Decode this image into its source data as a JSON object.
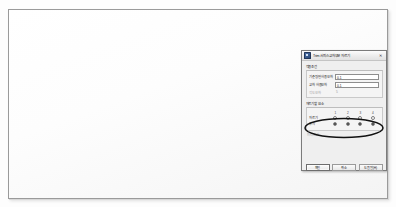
{
  "viewport": {
    "name": "3d-surface-viewport",
    "surface_type": "nurbs-wireframe-surface",
    "mesh_line_color": "#6b6b6b",
    "background": "#fdfdfd",
    "control_point_color": "#1a1a1a",
    "control_point_count": 4
  },
  "dialog": {
    "title": "Trim 서피스교차부분 자르기",
    "icon": "app-icon",
    "close_label": "✕",
    "group1": {
      "label": "적용조건",
      "fields": [
        {
          "label": "기준평면 허용오차",
          "value": "0.1",
          "disabled": false
        },
        {
          "label": "교차 허용오차",
          "value": "0.1",
          "disabled": false
        },
        {
          "label": "각도오차",
          "value": "5",
          "disabled": true
        }
      ]
    },
    "group2": {
      "label": "자르기할 요소",
      "col_headers": [
        "1",
        "2",
        "3",
        "4"
      ],
      "rows": [
        {
          "label": "자르기",
          "selected_index": -1
        },
        {
          "label": "유지",
          "selected_index": 3,
          "all_checked": true
        }
      ],
      "note": "미리보기"
    },
    "buttons": [
      {
        "label": "확인",
        "primary": true
      },
      {
        "label": "취소",
        "primary": false
      },
      {
        "label": "도움말(H)",
        "primary": false
      }
    ]
  },
  "annotation": {
    "name": "highlight-ellipse",
    "shape": "ellipse",
    "color": "#111111"
  }
}
